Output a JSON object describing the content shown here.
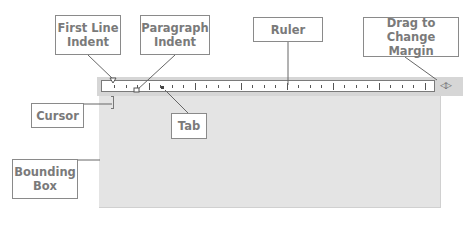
{
  "callouts": {
    "first_line_indent": "First Line Indent",
    "paragraph_indent": "Paragraph Indent",
    "ruler": "Ruler",
    "drag_margin": "Drag to Change Margin",
    "cursor": "Cursor",
    "tab": "Tab",
    "bounding_box": "Bounding Box"
  },
  "ruler": {
    "margin_handle": "◁▷"
  },
  "colors": {
    "callout_text": "#7a7a7a",
    "callout_border": "#8a8a8a",
    "doc_background": "#e4e4e4",
    "ruler_bar": "#d6d6d6"
  }
}
